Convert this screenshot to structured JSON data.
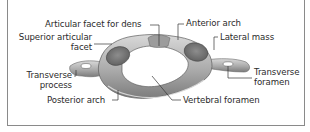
{
  "diagram": {
    "colors": {
      "bone_light": "#d6d6d6",
      "bone_mid": "#a9a9a9",
      "bone_dark": "#6f6f6f",
      "frame": "#8a8a8a",
      "label_text": "#2b2b2b",
      "leader_line": "#333333"
    },
    "labels": [
      {
        "id": "articular-facet-for-dens",
        "text": "Articular facet for dens"
      },
      {
        "id": "anterior-arch",
        "text": "Anterior arch"
      },
      {
        "id": "superior-articular-facet",
        "line1": "Superior articular",
        "line2": "facet"
      },
      {
        "id": "lateral-mass",
        "text": "Lateral mass"
      },
      {
        "id": "transverse-process",
        "line1": "Transverse",
        "line2": "process"
      },
      {
        "id": "transverse-foramen",
        "line1": "Transverse",
        "line2": "foramen"
      },
      {
        "id": "posterior-arch",
        "text": "Posterior arch"
      },
      {
        "id": "vertebral-foramen",
        "text": "Vertebral foramen"
      }
    ]
  }
}
